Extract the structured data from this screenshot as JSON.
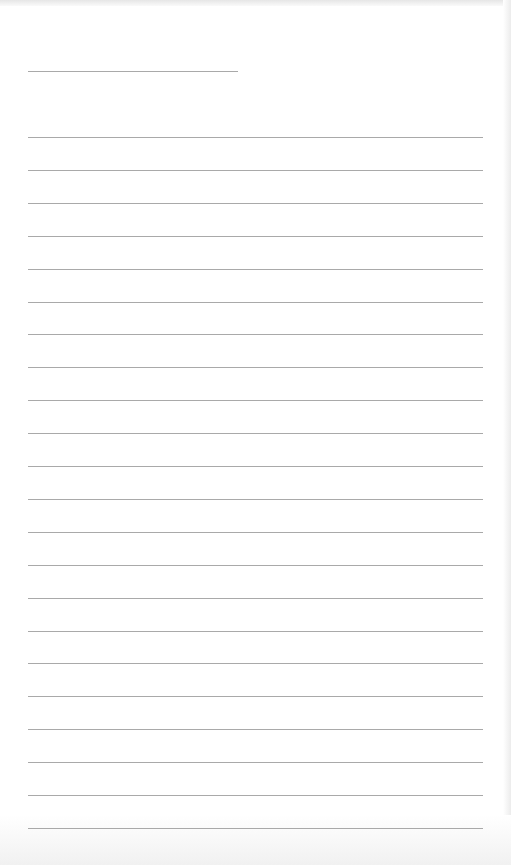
{
  "page": {
    "type": "lined-paper",
    "background": "#ffffff",
    "line_color": "#a9a9a9",
    "header_line": {
      "x": 28,
      "y": 71,
      "width": 210
    },
    "ruled_lines": {
      "count": 22,
      "start_y": 137,
      "spacing": 32.9,
      "x": 28,
      "width": 455
    }
  }
}
